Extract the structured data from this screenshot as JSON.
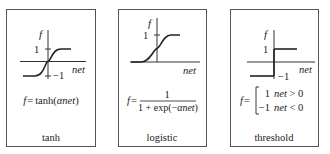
{
  "panels": [
    {
      "id": "tanh",
      "label": "tanh",
      "y_axis_label": "f",
      "x_axis_label": "net",
      "tick_pos": "1",
      "tick_neg": "−1",
      "formula": {
        "lhs": "f",
        "eq": "=",
        "text": "tanh(",
        "alpha": "α",
        "net": "net",
        "close": ")"
      }
    },
    {
      "id": "logistic",
      "label": "logistic",
      "y_axis_label": "f",
      "x_axis_label": "net",
      "tick_pos": "1",
      "formula": {
        "lhs": "f",
        "eq": "=",
        "numerator": "1",
        "denominator_pre": "1 + exp(−",
        "alpha": "α",
        "net": "net",
        "close": ")"
      }
    },
    {
      "id": "threshold",
      "label": "threshold",
      "y_axis_label": "f",
      "x_axis_label": "net",
      "tick_pos": "1",
      "tick_neg": "−1",
      "formula": {
        "lhs": "f",
        "eq": "=",
        "case1_value": "1",
        "case1_cond_net": "net",
        "case1_cond": " > 0",
        "case2_value": "−1",
        "case2_cond_net": "net",
        "case2_cond": " < 0"
      }
    }
  ]
}
